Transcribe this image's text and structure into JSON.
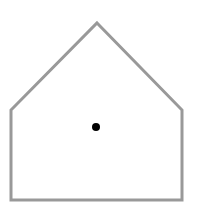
{
  "diagram": {
    "shape": "pentagon-house",
    "stroke_color": "#999999",
    "fill_color": "#ffffff",
    "point_color": "#000000",
    "vertices": [
      [
        97,
        23
      ],
      [
        182,
        110
      ],
      [
        182,
        200
      ],
      [
        11,
        200
      ],
      [
        11,
        110
      ]
    ],
    "center_point": {
      "x": 96,
      "y": 127,
      "r": 4
    }
  }
}
